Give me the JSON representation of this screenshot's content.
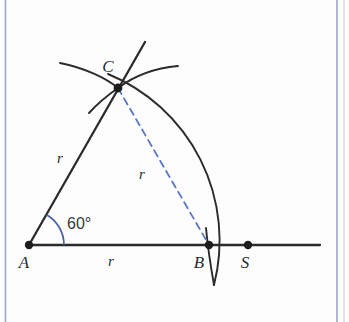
{
  "figure": {
    "background_color": "#fdfdfd",
    "border_color": "#9aa7ce",
    "ink_color": "#2b2b2b",
    "accent_color": "#4a5fa5",
    "dashed_color": "#5b77c4"
  },
  "points": [
    {
      "id": "A",
      "label": "A",
      "x": 29,
      "y": 245,
      "label_x": 24,
      "label_y": 268
    },
    {
      "id": "B",
      "label": "B",
      "x": 209,
      "y": 245,
      "label_x": 195,
      "label_y": 268
    },
    {
      "id": "C",
      "label": "C",
      "x": 118,
      "y": 88,
      "label_x": 108,
      "label_y": 72
    },
    {
      "id": "S",
      "label": "S",
      "x": 248,
      "y": 245,
      "label_x": 242,
      "label_y": 268
    }
  ],
  "segments": [
    {
      "id": "ray-AC",
      "name": "ray-through-A-and-C",
      "from": "A",
      "to": "C",
      "style": "solid"
    },
    {
      "id": "line-AS",
      "name": "baseline-A-to-S",
      "from": "A",
      "to": "S",
      "style": "solid"
    },
    {
      "id": "chord-CB",
      "name": "dashed-chord-C-to-B",
      "from": "C",
      "to": "B",
      "style": "dashed"
    }
  ],
  "length_labels": [
    {
      "id": "r-on-AC",
      "text": "r",
      "x": 60,
      "y": 163
    },
    {
      "id": "r-on-AB",
      "text": "r",
      "x": 111,
      "y": 265
    },
    {
      "id": "r-on-CB",
      "text": "r",
      "x": 142,
      "y": 178
    }
  ],
  "angle": {
    "id": "angle-at-A",
    "text": "60°",
    "value_degrees": 60,
    "vertex": "A",
    "arc_radius": 35,
    "label_x": 67,
    "label_y": 228
  },
  "arcs": [
    {
      "id": "main-arc",
      "name": "compass-arc-centered-at-A",
      "center": "A",
      "radius": 180
    },
    {
      "id": "construction-arc-left",
      "name": "compass-arc-left-crossing-at-C"
    },
    {
      "id": "construction-arc-right",
      "name": "compass-arc-right-crossing-at-C"
    }
  ]
}
